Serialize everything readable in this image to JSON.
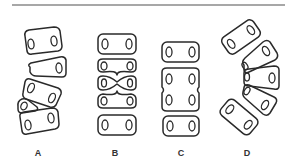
{
  "figure": {
    "type": "diagram",
    "top_rule": true,
    "colors": {
      "stroke": "#2a2a2a",
      "rule": "#8a8a8a",
      "label": "#333333",
      "background": "#ffffff"
    },
    "panels": [
      {
        "id": "A",
        "label": "A",
        "description": "Curved column with wedge-shaped (triangular) and hemi-vertebrae, tilted blocks"
      },
      {
        "id": "B",
        "label": "B",
        "description": "Straight column with butterfly / bow-tie shaped middle vertebra"
      },
      {
        "id": "C",
        "label": "C",
        "description": "Straight column with fused block vertebra (two segments merged)"
      },
      {
        "id": "D",
        "label": "D",
        "description": "Fan-shaped arc of wedge vertebrae converging on the left"
      }
    ]
  }
}
